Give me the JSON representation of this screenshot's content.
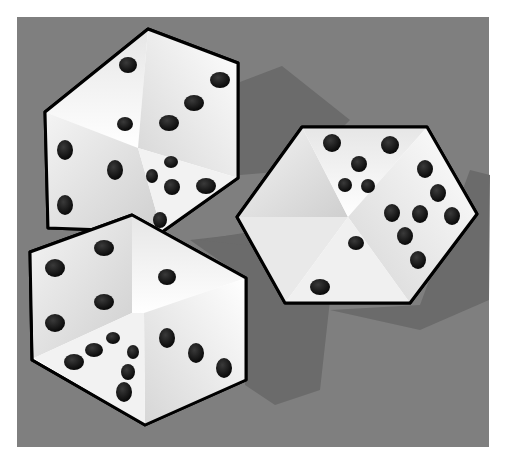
{
  "image": {
    "caption": "Three white dice with black pips on a gray background",
    "background_color": "#7d7d7d",
    "frame_color": "#ffffff",
    "die_outline_color": "#000000",
    "pip_color": "#0a0a0a",
    "shadow_color": "#6a6a6a"
  },
  "dice": [
    {
      "name": "top-left-die",
      "visible_faces": [
        2,
        3,
        5
      ]
    },
    {
      "name": "bottom-left-die",
      "visible_faces": [
        4,
        3,
        5
      ]
    },
    {
      "name": "right-die",
      "visible_faces": [
        5,
        6,
        2
      ]
    }
  ]
}
